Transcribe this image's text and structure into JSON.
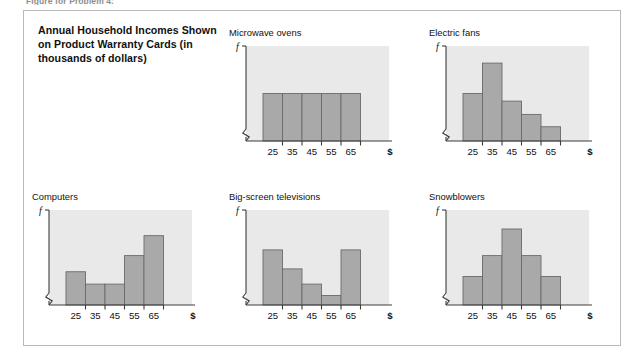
{
  "running_head": "Figure for Problem 4:",
  "panel": {
    "caption": "Annual Household Incomes Shown on Product Warranty Cards (in thousands of dollars)"
  },
  "axis": {
    "y_label": "f",
    "x_label": "$",
    "ticks": [
      "25",
      "35",
      "45",
      "55",
      "65"
    ]
  },
  "colors": {
    "bar_fill": "#a9a9a9",
    "bar_stroke": "#6b6b6b",
    "plot_bg": "#e9e9e9",
    "axis": "#3c3c3c",
    "frame": "#b9b9b9",
    "text": "#111111"
  },
  "chart_data": [
    {
      "type": "bar",
      "title": "Microwave ovens",
      "categories": [
        "25",
        "35",
        "45",
        "55",
        "65"
      ],
      "values": [
        50,
        50,
        50,
        50,
        50
      ],
      "xlabel": "$",
      "ylabel": "f",
      "ylim": [
        0,
        100
      ],
      "shape": "uniform",
      "grid": false,
      "legend": "none"
    },
    {
      "type": "bar",
      "title": "Electric fans",
      "categories": [
        "25",
        "35",
        "45",
        "55",
        "65"
      ],
      "values": [
        50,
        82,
        42,
        28,
        15
      ],
      "xlabel": "$",
      "ylabel": "f",
      "ylim": [
        0,
        100
      ],
      "shape": "skewed-right",
      "grid": false,
      "legend": "none"
    },
    {
      "type": "bar",
      "title": "Computers",
      "categories": [
        "25",
        "35",
        "45",
        "55",
        "65"
      ],
      "values": [
        35,
        22,
        22,
        52,
        73
      ],
      "xlabel": "$",
      "ylabel": "f",
      "ylim": [
        0,
        100
      ],
      "shape": "skewed-left",
      "grid": false,
      "legend": "none"
    },
    {
      "type": "bar",
      "title": "Big-screen televisions",
      "categories": [
        "25",
        "35",
        "45",
        "55",
        "65"
      ],
      "values": [
        58,
        38,
        22,
        10,
        58
      ],
      "xlabel": "$",
      "ylabel": "f",
      "ylim": [
        0,
        100
      ],
      "shape": "u-shaped",
      "grid": false,
      "legend": "none"
    },
    {
      "type": "bar",
      "title": "Snowblowers",
      "categories": [
        "25",
        "35",
        "45",
        "55",
        "65"
      ],
      "values": [
        30,
        52,
        80,
        52,
        30
      ],
      "xlabel": "$",
      "ylabel": "f",
      "ylim": [
        0,
        100
      ],
      "shape": "symmetric",
      "grid": false,
      "legend": "none"
    }
  ]
}
